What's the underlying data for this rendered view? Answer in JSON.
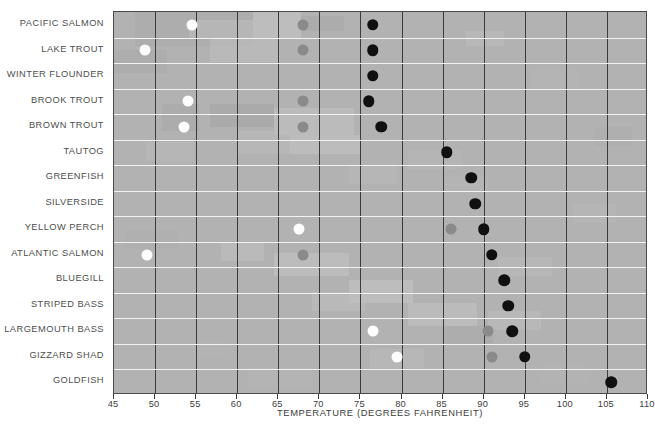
{
  "chart_data": {
    "type": "scatter",
    "title": "",
    "subtitle": "",
    "xlabel": "TEMPERATURE (DEGREES FAHRENHEIT)",
    "ylabel": "",
    "xlim": [
      45,
      110
    ],
    "xticks": [
      45,
      50,
      55,
      60,
      65,
      70,
      75,
      80,
      85,
      90,
      95,
      100,
      105,
      110
    ],
    "xtick_labels": [
      "45",
      "50",
      "55",
      "60",
      "65",
      "70",
      "75",
      "80",
      "85",
      "90",
      "95",
      "100",
      "105",
      "110"
    ],
    "grid": "vertical gridlines at every 5 degrees; horizontal white separators between species rows",
    "legend": "none shown",
    "marker_types": [
      {
        "key": "open",
        "label": "open circle",
        "color": "#fdfdfd"
      },
      {
        "key": "mid",
        "label": "gray circle",
        "color": "#8a8a8a"
      },
      {
        "key": "filled",
        "label": "filled black circle",
        "color": "#101010"
      }
    ],
    "categories": [
      "PACIFIC SALMON",
      "LAKE TROUT",
      "WINTER FLOUNDER",
      "BROOK TROUT",
      "BROWN TROUT",
      "TAUTOG",
      "GREENFISH",
      "SILVERSIDE",
      "YELLOW PERCH",
      "ATLANTIC SALMON",
      "BLUEGILL",
      "STRIPED BASS",
      "LARGEMOUTH BASS",
      "GIZZARD SHAD",
      "GOLDFISH"
    ],
    "series": [
      {
        "name": "open",
        "values": [
          54.5,
          48.8,
          null,
          54.0,
          53.5,
          null,
          null,
          null,
          67.5,
          49.0,
          null,
          null,
          76.5,
          79.5,
          null
        ]
      },
      {
        "name": "mid",
        "values": [
          68.0,
          68.0,
          null,
          68.0,
          68.0,
          null,
          null,
          null,
          86.0,
          68.0,
          null,
          null,
          90.5,
          91.0,
          null
        ]
      },
      {
        "name": "filled",
        "values": [
          76.5,
          76.5,
          76.5,
          76.0,
          77.5,
          85.5,
          88.5,
          89.0,
          90.0,
          91.0,
          92.5,
          93.0,
          93.5,
          95.0,
          105.5
        ]
      }
    ],
    "rows": [
      {
        "species": "PACIFIC SALMON",
        "open": 54.5,
        "mid": 68.0,
        "filled": 76.5
      },
      {
        "species": "LAKE TROUT",
        "open": 48.8,
        "mid": 68.0,
        "filled": 76.5
      },
      {
        "species": "WINTER FLOUNDER",
        "open": null,
        "mid": null,
        "filled": 76.5
      },
      {
        "species": "BROOK TROUT",
        "open": 54.0,
        "mid": 68.0,
        "filled": 76.0
      },
      {
        "species": "BROWN TROUT",
        "open": 53.5,
        "mid": 68.0,
        "filled": 77.5
      },
      {
        "species": "TAUTOG",
        "open": null,
        "mid": null,
        "filled": 85.5
      },
      {
        "species": "GREENFISH",
        "open": null,
        "mid": null,
        "filled": 88.5
      },
      {
        "species": "SILVERSIDE",
        "open": null,
        "mid": null,
        "filled": 89.0
      },
      {
        "species": "YELLOW PERCH",
        "open": 67.5,
        "mid": 86.0,
        "filled": 90.0
      },
      {
        "species": "ATLANTIC SALMON",
        "open": 49.0,
        "mid": 68.0,
        "filled": 91.0
      },
      {
        "species": "BLUEGILL",
        "open": null,
        "mid": null,
        "filled": 92.5
      },
      {
        "species": "STRIPED BASS",
        "open": null,
        "mid": null,
        "filled": 93.0
      },
      {
        "species": "LARGEMOUTH BASS",
        "open": 76.5,
        "mid": 90.5,
        "filled": 93.5
      },
      {
        "species": "GIZZARD SHAD",
        "open": 79.5,
        "mid": 91.0,
        "filled": 95.0
      },
      {
        "species": "GOLDFISH",
        "open": null,
        "mid": null,
        "filled": 105.5
      }
    ]
  },
  "colors": {
    "plot_background": "#b2b2b2",
    "vertical_gridline": "#3b3b3b",
    "horizontal_separator": "#f2f2f2",
    "text": "#4e4e4e",
    "page_background": "#ffffff"
  }
}
